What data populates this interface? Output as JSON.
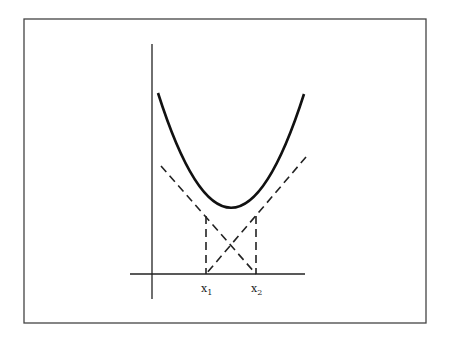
{
  "figure": {
    "labels": {
      "x1_base": "x",
      "x1_sub": "1",
      "x2_base": "x",
      "x2_sub": "2"
    },
    "colors": {
      "ink": "#222222",
      "frame": "#444444",
      "background": "#ffffff"
    }
  }
}
